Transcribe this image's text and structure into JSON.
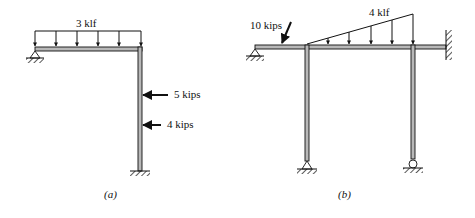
{
  "figure_a": {
    "caption": "(a)",
    "distributed_load": "3 klf",
    "point_load_upper": "5 kips",
    "point_load_lower": "4 kips",
    "supports": [
      "pin-left",
      "fixed-base"
    ]
  },
  "figure_b": {
    "caption": "(b)",
    "inclined_load": "10 kips",
    "triangular_load": "4 klf",
    "supports": [
      "pin-left",
      "fixed-right-wall",
      "pin-base-left-column",
      "roller-base-right-column"
    ]
  },
  "colors": {
    "member_fill": "#b8b8b8",
    "line": "#111111"
  }
}
